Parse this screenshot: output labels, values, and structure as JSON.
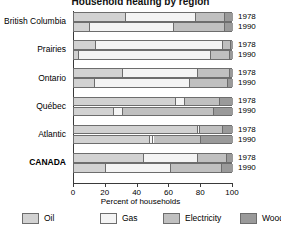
{
  "chart_data": {
    "type": "bar",
    "orientation": "horizontal",
    "stacked": true,
    "title": "Household heating by region",
    "xlabel": "Percent of households",
    "ylabel": "",
    "xlim": [
      0,
      100
    ],
    "xticks": [
      0,
      20,
      40,
      60,
      80,
      100
    ],
    "grid": false,
    "legend_position": "bottom",
    "series": [
      {
        "name": "Oil",
        "color": "#d2d2d2"
      },
      {
        "name": "Gas",
        "color": "#f4f4f4"
      },
      {
        "name": "Electricity",
        "color": "#c0c0c0"
      },
      {
        "name": "Wood",
        "color": "#9a9a9a"
      }
    ],
    "groups": [
      {
        "region": "British Columbia",
        "bold": false,
        "rows": [
          {
            "year": "1978",
            "values": {
              "Oil": 33,
              "Gas": 44,
              "Electricity": 18,
              "Wood": 5
            }
          },
          {
            "year": "1990",
            "values": {
              "Oil": 10,
              "Gas": 53,
              "Electricity": 32,
              "Wood": 5
            }
          }
        ]
      },
      {
        "region": "Prairies",
        "bold": false,
        "rows": [
          {
            "year": "1978",
            "values": {
              "Oil": 14,
              "Gas": 80,
              "Electricity": 5,
              "Wood": 1
            }
          },
          {
            "year": "1990",
            "values": {
              "Oil": 3,
              "Gas": 83,
              "Electricity": 12,
              "Wood": 2
            }
          }
        ]
      },
      {
        "region": "Ontario",
        "bold": false,
        "rows": [
          {
            "year": "1978",
            "values": {
              "Oil": 31,
              "Gas": 47,
              "Electricity": 20,
              "Wood": 2
            }
          },
          {
            "year": "1990",
            "values": {
              "Oil": 13,
              "Gas": 60,
              "Electricity": 24,
              "Wood": 3
            }
          }
        ]
      },
      {
        "region": "Québec",
        "bold": false,
        "rows": [
          {
            "year": "1978",
            "values": {
              "Oil": 64,
              "Gas": 6,
              "Electricity": 22,
              "Wood": 8
            }
          },
          {
            "year": "1990",
            "values": {
              "Oil": 25,
              "Gas": 6,
              "Electricity": 57,
              "Wood": 12
            }
          }
        ]
      },
      {
        "region": "Atlantic",
        "bold": false,
        "rows": [
          {
            "year": "1978",
            "values": {
              "Oil": 78,
              "Gas": 1,
              "Electricity": 15,
              "Wood": 6
            }
          },
          {
            "year": "1990",
            "values": {
              "Oil": 48,
              "Gas": 2,
              "Electricity": 30,
              "Wood": 20
            }
          }
        ]
      },
      {
        "region": "CANADA",
        "bold": true,
        "rows": [
          {
            "year": "1978",
            "values": {
              "Oil": 44,
              "Gas": 34,
              "Electricity": 18,
              "Wood": 4
            }
          },
          {
            "year": "1990",
            "values": {
              "Oil": 20,
              "Gas": 41,
              "Electricity": 32,
              "Wood": 7
            }
          }
        ]
      }
    ]
  },
  "legend": {
    "items": [
      {
        "label": "Oil"
      },
      {
        "label": "Gas"
      },
      {
        "label": "Electricity"
      },
      {
        "label": "Wood"
      }
    ]
  }
}
